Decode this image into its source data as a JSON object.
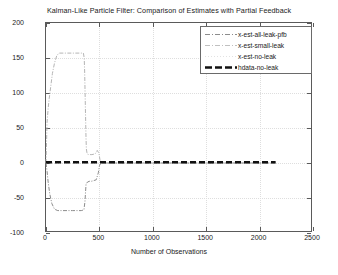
{
  "chart_data": {
    "type": "line",
    "title": "Kalman-Like Particle Filter: Comparison of Estimates with Partial Feedback",
    "xlabel": "Number of Observations",
    "ylabel": "State-estimate",
    "xlim": [
      0,
      2500
    ],
    "ylim": [
      -100,
      200
    ],
    "xticks": [
      0,
      500,
      1000,
      1500,
      2000,
      2500
    ],
    "yticks": [
      -100,
      -50,
      0,
      50,
      100,
      150,
      200
    ],
    "xtick_labels": [
      "0",
      "500",
      "1000",
      "1500",
      "2000",
      "2500"
    ],
    "ytick_labels": [
      "-100",
      "-50",
      "0",
      "50",
      "100",
      "150",
      "200"
    ],
    "grid": true,
    "legend_position": "top-right",
    "series": [
      {
        "name": "x-est-all-leak-pfb",
        "style": "dash-dot",
        "color": "#8c8c8c",
        "points": [
          [
            0,
            0
          ],
          [
            10,
            -12
          ],
          [
            20,
            -27
          ],
          [
            35,
            -44
          ],
          [
            55,
            -58
          ],
          [
            80,
            -66
          ],
          [
            110,
            -68
          ],
          [
            150,
            -68
          ],
          [
            200,
            -68
          ],
          [
            250,
            -68
          ],
          [
            300,
            -68
          ],
          [
            330,
            -68
          ],
          [
            355,
            -67
          ],
          [
            365,
            -55
          ],
          [
            370,
            -42
          ],
          [
            375,
            -30
          ],
          [
            390,
            -27
          ],
          [
            410,
            -26
          ],
          [
            430,
            -26
          ],
          [
            450,
            -25
          ],
          [
            470,
            -24
          ],
          [
            490,
            -14
          ],
          [
            500,
            -4
          ],
          [
            510,
            -1
          ],
          [
            530,
            0
          ],
          [
            600,
            0
          ],
          [
            900,
            0
          ],
          [
            1400,
            0
          ],
          [
            2000,
            0
          ],
          [
            2150,
            0
          ]
        ]
      },
      {
        "name": "x-est-small-leak",
        "style": "dash-dot-light",
        "color": "#b5b5b5",
        "points": [
          [
            0,
            0
          ],
          [
            10,
            58
          ],
          [
            20,
            78
          ],
          [
            30,
            92
          ],
          [
            45,
            110
          ],
          [
            60,
            128
          ],
          [
            80,
            143
          ],
          [
            100,
            153
          ],
          [
            120,
            157
          ],
          [
            150,
            157
          ],
          [
            200,
            157
          ],
          [
            250,
            157
          ],
          [
            300,
            157
          ],
          [
            330,
            157
          ],
          [
            350,
            157
          ],
          [
            358,
            150
          ],
          [
            362,
            130
          ],
          [
            366,
            100
          ],
          [
            370,
            70
          ],
          [
            374,
            40
          ],
          [
            378,
            20
          ],
          [
            385,
            13
          ],
          [
            400,
            12
          ],
          [
            430,
            12
          ],
          [
            460,
            13
          ],
          [
            480,
            18
          ],
          [
            495,
            14
          ],
          [
            505,
            5
          ],
          [
            515,
            1
          ],
          [
            540,
            0
          ],
          [
            700,
            0
          ],
          [
            1200,
            0
          ],
          [
            1800,
            0
          ],
          [
            2150,
            0
          ]
        ]
      },
      {
        "name": "x-est-no-leak",
        "style": "dotted",
        "color": "#d0d0d0",
        "points": [
          [
            0,
            0
          ],
          [
            100,
            0
          ],
          [
            400,
            0
          ],
          [
            800,
            0
          ],
          [
            1400,
            0
          ],
          [
            2000,
            0
          ],
          [
            2150,
            0
          ]
        ]
      },
      {
        "name": "hdata-no-leak",
        "style": "thick-dashed",
        "color": "#111111",
        "points": [
          [
            0,
            1
          ],
          [
            200,
            1
          ],
          [
            500,
            1
          ],
          [
            900,
            1
          ],
          [
            1300,
            1
          ],
          [
            1700,
            1
          ],
          [
            2000,
            1
          ],
          [
            2150,
            1
          ]
        ]
      }
    ]
  },
  "legend": {
    "items": [
      {
        "label": "x-est-all-leak-pfb"
      },
      {
        "label": "x-est-small-leak"
      },
      {
        "label": "x-est-no-leak"
      },
      {
        "label": "hdata-no-leak"
      }
    ]
  }
}
